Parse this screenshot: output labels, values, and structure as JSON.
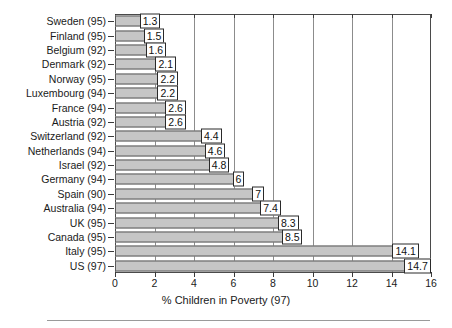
{
  "chart_data": {
    "type": "bar",
    "orientation": "horizontal",
    "title": "",
    "xlabel": "% Children in Poverty (97)",
    "ylabel": "",
    "xlim": [
      0,
      16
    ],
    "xticks": [
      0,
      2,
      4,
      6,
      8,
      10,
      12,
      14,
      16
    ],
    "grid": true,
    "legend": false,
    "categories": [
      "Sweden (95)",
      "Finland (95)",
      "Belgium (92)",
      "Denmark (92)",
      "Norway (95)",
      "Luxembourg (94)",
      "France (94)",
      "Austria (92)",
      "Switzerland (92)",
      "Netherlands (94)",
      "Israel (92)",
      "Germany (94)",
      "Spain (90)",
      "Australia (94)",
      "UK (95)",
      "Canada (95)",
      "Italy (95)",
      "US (97)"
    ],
    "values": [
      1.3,
      1.5,
      1.6,
      2.1,
      2.2,
      2.2,
      2.6,
      2.6,
      4.4,
      4.6,
      4.8,
      6,
      7,
      7.4,
      8.3,
      8.5,
      14.1,
      14.7
    ],
    "value_labels": [
      "1.3",
      "1.5",
      "1.6",
      "2.1",
      "2.2",
      "2.2",
      "2.6",
      "2.6",
      "4.4",
      "4.6",
      "4.8",
      "6",
      "7",
      "7.4",
      "8.3",
      "8.5",
      "14.1",
      "14.7"
    ],
    "bar_color": "#c6c6c6",
    "bar_border_color": "#5a5a5a",
    "grid_color": "#8c8c8c",
    "axis_color": "#4a4a4a",
    "text_color": "#1a1a1a"
  }
}
